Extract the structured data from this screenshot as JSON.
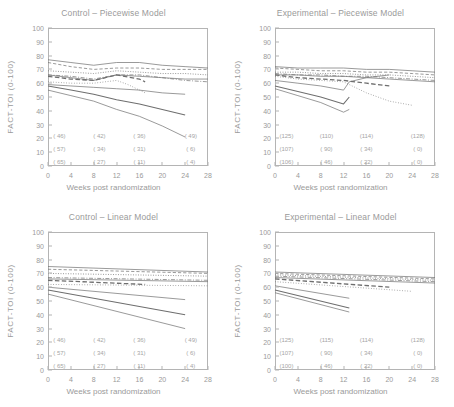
{
  "figure": {
    "axis": {
      "xlabel": "Weeks post randomization",
      "ylabel": "FACT-TOI (0-100)",
      "xticks": [
        0,
        4,
        8,
        12,
        16,
        20,
        24,
        28
      ],
      "yticks": [
        0,
        10,
        20,
        30,
        40,
        50,
        60,
        70,
        80,
        90,
        100
      ],
      "xlim": [
        0,
        28
      ],
      "ylim": [
        0,
        100
      ]
    },
    "colors": {
      "line": "#6e6e6e",
      "frame": "#b4b4b4",
      "text": "#9a9a9a"
    }
  },
  "chart_data": [
    {
      "type": "line",
      "panel": "top-left",
      "title": "Control – Piecewise Model",
      "xlabel": "Weeks post randomization",
      "ylabel": "FACT-TOI (0-100)",
      "xlim": [
        0,
        28
      ],
      "ylim": [
        0,
        100
      ],
      "xticks": [
        0,
        4,
        8,
        12,
        16,
        20,
        24,
        28
      ],
      "yticks": [
        0,
        10,
        20,
        30,
        40,
        50,
        60,
        70,
        80,
        90,
        100
      ],
      "grid": false,
      "legend": "none",
      "series": [
        {
          "name": "s1",
          "style": "solid",
          "x": [
            0,
            4,
            8,
            12,
            16,
            20,
            24,
            28
          ],
          "y": [
            77,
            75,
            73,
            75,
            75,
            73,
            72,
            71
          ]
        },
        {
          "name": "s2",
          "style": "dashed",
          "x": [
            0,
            4,
            8,
            12,
            16,
            20,
            24,
            28
          ],
          "y": [
            75,
            72,
            70,
            71,
            71,
            70,
            70,
            70
          ]
        },
        {
          "name": "s3",
          "style": "dotted",
          "x": [
            0,
            4,
            8,
            12,
            16,
            20,
            24,
            28
          ],
          "y": [
            69,
            68,
            67,
            69,
            68,
            67,
            67,
            66
          ]
        },
        {
          "name": "s4",
          "style": "dashdot",
          "x": [
            0,
            4,
            8,
            12,
            16,
            20,
            24,
            28
          ],
          "y": [
            66,
            65,
            63,
            66,
            66,
            64,
            62,
            61
          ]
        },
        {
          "name": "s5",
          "style": "solid",
          "x": [
            0,
            4,
            8,
            12,
            16,
            20,
            24,
            28
          ],
          "y": [
            66,
            64,
            62,
            66,
            65,
            64,
            63,
            63
          ]
        },
        {
          "name": "s6",
          "style": "dashed-bold",
          "x": [
            0,
            4,
            8,
            12,
            16,
            17
          ],
          "y": [
            65,
            63,
            62,
            66,
            63,
            61
          ]
        },
        {
          "name": "s7",
          "style": "dotted-fine",
          "x": [
            0,
            4,
            8,
            12,
            14,
            16,
            17
          ],
          "y": [
            61,
            60,
            60,
            62,
            59,
            55,
            53
          ]
        },
        {
          "name": "s8",
          "style": "solid",
          "x": [
            0,
            4,
            8,
            12,
            16,
            20,
            24
          ],
          "y": [
            59,
            58,
            57,
            56,
            55,
            53,
            52
          ]
        },
        {
          "name": "s9",
          "style": "solid-bold",
          "x": [
            0,
            4,
            8,
            12,
            16,
            20,
            24
          ],
          "y": [
            58,
            55,
            52,
            48,
            45,
            41,
            37
          ]
        },
        {
          "name": "s10",
          "style": "solid",
          "x": [
            0,
            4,
            8,
            12,
            16,
            20,
            24
          ],
          "y": [
            55,
            51,
            47,
            41,
            36,
            29,
            21
          ]
        }
      ],
      "annotations": {
        "rows": [
          {
            "x": [
              2,
              9,
              16,
              25
            ],
            "labels": [
              "( 46)",
              "( 42)",
              "( 36)",
              "( 49)"
            ],
            "y": 22
          },
          {
            "x": [
              2,
              9,
              16,
              25
            ],
            "labels": [
              "( 57)",
              "( 34)",
              "( 31)",
              "(  6)"
            ],
            "y": 12
          },
          {
            "x": [
              2,
              9,
              16,
              25
            ],
            "labels": [
              "( 65)",
              "( 27)",
              "( 11)",
              "(  4)"
            ],
            "y": 3
          }
        ]
      }
    },
    {
      "type": "line",
      "panel": "top-right",
      "title": "Experimental – Piecewise Model",
      "xlabel": "Weeks post randomization",
      "ylabel": "FACT-TOI (0-100)",
      "xlim": [
        0,
        28
      ],
      "ylim": [
        0,
        100
      ],
      "xticks": [
        0,
        4,
        8,
        12,
        16,
        20,
        24,
        28
      ],
      "yticks": [
        0,
        10,
        20,
        30,
        40,
        50,
        60,
        70,
        80,
        90,
        100
      ],
      "grid": false,
      "legend": "none",
      "series": [
        {
          "name": "s1",
          "style": "solid",
          "x": [
            0,
            4,
            8,
            12,
            16,
            20,
            24,
            28
          ],
          "y": [
            72,
            71,
            71,
            71,
            70,
            70,
            69,
            68
          ]
        },
        {
          "name": "s2",
          "style": "dashed",
          "x": [
            0,
            4,
            8,
            12,
            16,
            20,
            24,
            28
          ],
          "y": [
            71,
            70,
            69,
            69,
            68,
            68,
            67,
            66
          ]
        },
        {
          "name": "s3",
          "style": "dotted",
          "x": [
            0,
            4,
            8,
            12,
            16,
            20,
            24,
            28
          ],
          "y": [
            68,
            68,
            67,
            67,
            66,
            66,
            65,
            64
          ]
        },
        {
          "name": "s4",
          "style": "dashdot",
          "x": [
            0,
            4,
            8,
            12,
            16,
            20,
            24,
            28
          ],
          "y": [
            67,
            66,
            66,
            65,
            65,
            64,
            63,
            62
          ]
        },
        {
          "name": "s5",
          "style": "solid",
          "x": [
            0,
            4,
            8,
            12,
            16,
            20,
            24,
            28
          ],
          "y": [
            66,
            66,
            65,
            65,
            64,
            63,
            62,
            61
          ]
        },
        {
          "name": "s6",
          "style": "dashed-bold",
          "x": [
            0,
            4,
            8,
            12,
            16,
            20
          ],
          "y": [
            66,
            64,
            63,
            62,
            60,
            58
          ]
        },
        {
          "name": "s7",
          "style": "dotted-fine",
          "x": [
            0,
            4,
            8,
            12,
            16,
            20,
            24
          ],
          "y": [
            65,
            63,
            62,
            61,
            53,
            47,
            44
          ]
        },
        {
          "name": "s8",
          "style": "solid",
          "x": [
            0,
            4,
            8,
            12,
            13,
            16,
            20
          ],
          "y": [
            62,
            60,
            58,
            55,
            61,
            64,
            66
          ]
        },
        {
          "name": "s9",
          "style": "solid-bold",
          "x": [
            0,
            4,
            8,
            12,
            13
          ],
          "y": [
            58,
            54,
            50,
            45,
            50
          ]
        },
        {
          "name": "s10",
          "style": "solid",
          "x": [
            0,
            4,
            8,
            12,
            13
          ],
          "y": [
            56,
            51,
            46,
            39,
            41
          ]
        }
      ],
      "annotations": {
        "rows": [
          {
            "x": [
              2,
              9,
              16,
              25
            ],
            "labels": [
              "(125)",
              "(110)",
              "(114)",
              "(128)"
            ],
            "y": 22
          },
          {
            "x": [
              2,
              9,
              16,
              25
            ],
            "labels": [
              "(107)",
              "( 90)",
              "( 34)",
              "(  0)"
            ],
            "y": 12
          },
          {
            "x": [
              2,
              9,
              16,
              25
            ],
            "labels": [
              "(106)",
              "( 46)",
              "( 22)",
              "(  0)"
            ],
            "y": 3
          }
        ]
      }
    },
    {
      "type": "line",
      "panel": "bottom-left",
      "title": "Control – Linear Model",
      "xlabel": "Weeks post randomization",
      "ylabel": "FACT-TOI (0-100)",
      "xlim": [
        0,
        28
      ],
      "ylim": [
        0,
        100
      ],
      "xticks": [
        0,
        4,
        8,
        12,
        16,
        20,
        24,
        28
      ],
      "yticks": [
        0,
        10,
        20,
        30,
        40,
        50,
        60,
        70,
        80,
        90,
        100
      ],
      "grid": false,
      "legend": "none",
      "series": [
        {
          "name": "s1",
          "style": "solid",
          "x": [
            0,
            28
          ],
          "y": [
            75,
            71
          ]
        },
        {
          "name": "s2",
          "style": "dashed",
          "x": [
            0,
            28
          ],
          "y": [
            73,
            70
          ]
        },
        {
          "name": "s3",
          "style": "dotted",
          "x": [
            0,
            28
          ],
          "y": [
            70,
            68
          ]
        },
        {
          "name": "s4",
          "style": "dashdot",
          "x": [
            0,
            28
          ],
          "y": [
            67,
            65
          ]
        },
        {
          "name": "s5",
          "style": "solid",
          "x": [
            0,
            28
          ],
          "y": [
            66,
            64
          ]
        },
        {
          "name": "s6",
          "style": "dashed-bold",
          "x": [
            0,
            17
          ],
          "y": [
            65,
            62
          ]
        },
        {
          "name": "s7",
          "style": "dotted-fine",
          "x": [
            0,
            28
          ],
          "y": [
            62,
            61
          ]
        },
        {
          "name": "s8",
          "style": "solid",
          "x": [
            0,
            24
          ],
          "y": [
            60,
            51
          ]
        },
        {
          "name": "s9",
          "style": "solid-bold",
          "x": [
            0,
            24
          ],
          "y": [
            58,
            40
          ]
        },
        {
          "name": "s10",
          "style": "solid",
          "x": [
            0,
            24
          ],
          "y": [
            55,
            30
          ]
        }
      ],
      "annotations": {
        "rows": [
          {
            "x": [
              2,
              9,
              16,
              25
            ],
            "labels": [
              "( 46)",
              "( 42)",
              "( 36)",
              "( 49)"
            ],
            "y": 22
          },
          {
            "x": [
              2,
              9,
              16,
              25
            ],
            "labels": [
              "( 57)",
              "( 34)",
              "( 31)",
              "(  6)"
            ],
            "y": 12
          },
          {
            "x": [
              2,
              9,
              16,
              25
            ],
            "labels": [
              "( 65)",
              "( 27)",
              "( 11)",
              "(  4)"
            ],
            "y": 3
          }
        ]
      }
    },
    {
      "type": "line",
      "panel": "bottom-right",
      "title": "Experimental – Linear Model",
      "xlabel": "Weeks post randomization",
      "ylabel": "FACT-TOI (0-100)",
      "xlim": [
        0,
        28
      ],
      "ylim": [
        0,
        100
      ],
      "xticks": [
        0,
        4,
        8,
        12,
        16,
        20,
        24,
        28
      ],
      "yticks": [
        0,
        10,
        20,
        30,
        40,
        50,
        60,
        70,
        80,
        90,
        100
      ],
      "grid": false,
      "legend": "none",
      "series": [
        {
          "name": "s1",
          "style": "solid",
          "x": [
            0,
            28
          ],
          "y": [
            71,
            67
          ]
        },
        {
          "name": "s2",
          "style": "dashed",
          "x": [
            0,
            28
          ],
          "y": [
            70,
            66
          ]
        },
        {
          "name": "s3",
          "style": "dotted",
          "x": [
            0,
            28
          ],
          "y": [
            69,
            65
          ]
        },
        {
          "name": "s4",
          "style": "dashdot",
          "x": [
            0,
            28
          ],
          "y": [
            68,
            64
          ]
        },
        {
          "name": "s5",
          "style": "solid",
          "x": [
            0,
            28
          ],
          "y": [
            67,
            63
          ]
        },
        {
          "name": "s6",
          "style": "dashed-bold",
          "x": [
            0,
            20
          ],
          "y": [
            66,
            60
          ]
        },
        {
          "name": "s7",
          "style": "dotted-fine",
          "x": [
            0,
            24
          ],
          "y": [
            64,
            57
          ]
        },
        {
          "name": "s8",
          "style": "solid",
          "x": [
            0,
            13
          ],
          "y": [
            61,
            52
          ]
        },
        {
          "name": "s9",
          "style": "solid-bold",
          "x": [
            0,
            13
          ],
          "y": [
            58,
            45
          ]
        },
        {
          "name": "s10",
          "style": "solid",
          "x": [
            0,
            13
          ],
          "y": [
            56,
            42
          ]
        }
      ],
      "annotations": {
        "rows": [
          {
            "x": [
              2,
              9,
              16,
              25
            ],
            "labels": [
              "(125)",
              "(115)",
              "(114)",
              "(128)"
            ],
            "y": 22
          },
          {
            "x": [
              2,
              9,
              16,
              25
            ],
            "labels": [
              "(107)",
              "( 90)",
              "( 34)",
              "(  0)"
            ],
            "y": 12
          },
          {
            "x": [
              2,
              9,
              16,
              25
            ],
            "labels": [
              "(100)",
              "( 46)",
              "( 22)",
              "(  0)"
            ],
            "y": 3
          }
        ]
      }
    }
  ]
}
